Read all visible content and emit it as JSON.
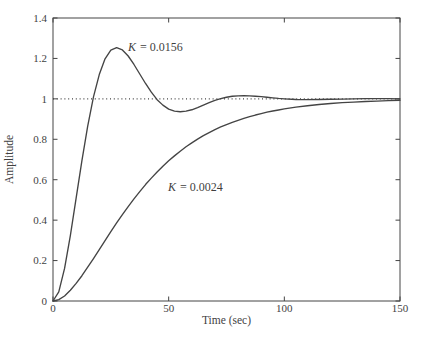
{
  "figure": {
    "background": "#ffffff",
    "ink_color": "#444444",
    "text_color": "#3f3f3f"
  },
  "chart_data": {
    "type": "line",
    "title": "",
    "xlabel": "Time (sec)",
    "ylabel": "Amplitude",
    "xlim": [
      0,
      150
    ],
    "ylim": [
      0,
      1.4
    ],
    "x_ticks": [
      0,
      50,
      100,
      150
    ],
    "x_tick_labels": [
      "0",
      "50",
      "100",
      "150"
    ],
    "y_ticks": [
      0,
      0.2,
      0.4,
      0.6,
      0.8,
      1,
      1.2,
      1.4
    ],
    "y_tick_labels": [
      "0",
      "0.2",
      "0.4",
      "0.6",
      "0.8",
      "1",
      "1.2",
      "1.4"
    ],
    "grid": false,
    "legend_position": "none",
    "reference_line": {
      "y": 1,
      "style": "dotted"
    },
    "x": [
      0,
      2.5,
      5,
      7.5,
      10,
      12.5,
      15,
      17.5,
      20,
      22.5,
      25,
      27.5,
      30,
      32.5,
      35,
      37.5,
      40,
      42.5,
      45,
      47.5,
      50,
      52.5,
      55,
      57.5,
      60,
      62.5,
      65,
      67.5,
      70,
      72.5,
      75,
      77.5,
      80,
      82.5,
      85,
      87.5,
      90,
      92.5,
      95,
      97.5,
      100,
      105,
      110,
      115,
      120,
      125,
      130,
      135,
      140,
      145,
      150
    ],
    "series": [
      {
        "name": "K = 0.0156",
        "label": {
          "var": "K",
          "rest": "= 0.0156",
          "t": 32.4,
          "y": 1.237
        },
        "values": [
          0,
          0.045,
          0.161,
          0.324,
          0.509,
          0.694,
          0.865,
          1.01,
          1.12,
          1.198,
          1.241,
          1.253,
          1.242,
          1.212,
          1.17,
          1.123,
          1.076,
          1.033,
          0.996,
          0.969,
          0.949,
          0.939,
          0.936,
          0.939,
          0.946,
          0.957,
          0.969,
          0.981,
          0.992,
          1.001,
          1.008,
          1.013,
          1.015,
          1.016,
          1.015,
          1.013,
          1.011,
          1.008,
          1.005,
          1.002,
          1.0,
          0.997,
          0.996,
          0.997,
          0.998,
          0.999,
          1.0,
          1.001,
          1.001,
          1.001,
          1.0
        ]
      },
      {
        "name": "K = 0.0024",
        "label": {
          "var": "K",
          "rest": "= 0.0024",
          "t": 49.7,
          "y": 0.544
        },
        "values": [
          0,
          0.007,
          0.025,
          0.053,
          0.087,
          0.125,
          0.167,
          0.21,
          0.254,
          0.299,
          0.343,
          0.386,
          0.427,
          0.467,
          0.505,
          0.541,
          0.576,
          0.608,
          0.638,
          0.667,
          0.694,
          0.718,
          0.741,
          0.763,
          0.782,
          0.801,
          0.818,
          0.833,
          0.848,
          0.861,
          0.873,
          0.884,
          0.894,
          0.903,
          0.912,
          0.92,
          0.927,
          0.934,
          0.94,
          0.945,
          0.95,
          0.959,
          0.966,
          0.972,
          0.977,
          0.981,
          0.984,
          0.987,
          0.989,
          0.991,
          0.993
        ]
      }
    ]
  }
}
